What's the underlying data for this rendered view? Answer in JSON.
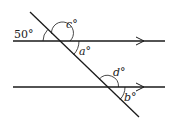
{
  "diagram": {
    "type": "parallel-lines-transversal",
    "lines": [
      {
        "id": "upper-parallel-line",
        "y": 41,
        "x1": 13,
        "x2": 165,
        "arrow_x": 142
      },
      {
        "id": "lower-parallel-line",
        "y": 87,
        "x1": 13,
        "x2": 165,
        "arrow_x": 142
      }
    ],
    "transversal": {
      "x1": 30,
      "y1": 12,
      "x2": 139,
      "y2": 117
    },
    "angles": [
      {
        "name": "angle-50",
        "label": "50°",
        "x": 27,
        "y": 38
      },
      {
        "name": "angle-c",
        "label_var": "c",
        "label_deg": "°",
        "x": 69,
        "y": 28
      },
      {
        "name": "angle-a",
        "label_var": "a",
        "label_deg": "°",
        "x": 80,
        "y": 54
      },
      {
        "name": "angle-d",
        "label_var": "d",
        "label_deg": "°",
        "x": 115,
        "y": 74
      },
      {
        "name": "angle-b",
        "label_var": "b",
        "label_deg": "°",
        "x": 126,
        "y": 101
      }
    ],
    "stroke_color": "#1a1a1a"
  }
}
